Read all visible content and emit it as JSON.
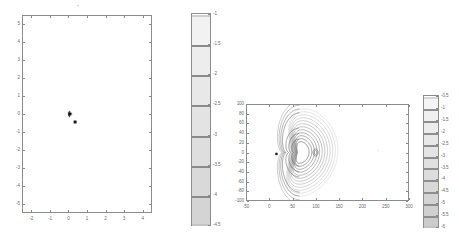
{
  "figure": {
    "background": "#ffffff",
    "axis_color": "#8c8c8c",
    "label_color": "#6b6b6b",
    "marker_color": "#1a1a1a"
  },
  "chart_data": [
    {
      "id": "left-contour",
      "type": "contour",
      "title": "",
      "xlabel": "",
      "ylabel": "",
      "xlim": [
        -2.5,
        4.5
      ],
      "ylim": [
        -5.5,
        5.5
      ],
      "xticks": [
        -2,
        -1,
        0,
        1,
        2,
        3,
        4
      ],
      "yticks": [
        5,
        4,
        3,
        2,
        1,
        0,
        -1,
        -2,
        -3,
        -4,
        -5
      ],
      "xticklabels": [
        "-2",
        "-1",
        "0",
        "1",
        "2",
        "3",
        "4"
      ],
      "yticklabels": [
        "5",
        "4",
        "3",
        "2",
        "1",
        "0",
        "-1",
        "-2",
        "-3",
        "-4",
        "-5"
      ],
      "grid": false,
      "legend": null,
      "contour_levels": [
        -1,
        -1.5,
        -2,
        -2.5,
        -3,
        -3.5,
        -4,
        -4.5
      ],
      "level_colors": [
        "#c9c9c9",
        "#b5b5b5",
        "#9e9e9e",
        "#8a8a8a",
        "#767676",
        "#626262",
        "#4e4e4e",
        "#3a3a3a"
      ],
      "marker": {
        "x": 0.35,
        "y": -0.45,
        "shape": "square",
        "color": "#1a1a1a"
      },
      "feature_center": {
        "x": 1.0,
        "y": 0.0
      },
      "description": "nested lens-shaped contour rings, cusp on left edge, saddle node near x=2"
    },
    {
      "id": "right-contour",
      "type": "contour",
      "title": "",
      "xlabel": "",
      "ylabel": "",
      "xlim": [
        -50,
        300
      ],
      "ylim": [
        -100,
        100
      ],
      "xticks": [
        -50,
        0,
        50,
        100,
        150,
        200,
        250,
        300
      ],
      "yticks": [
        100,
        80,
        60,
        40,
        20,
        0,
        -20,
        -40,
        -60,
        -80,
        -100
      ],
      "xticklabels": [
        "-50",
        "0",
        "50",
        "100",
        "150",
        "200",
        "250",
        "300"
      ],
      "yticklabels": [
        "100",
        "80",
        "60",
        "40",
        "20",
        "0",
        "-20",
        "-40",
        "-60",
        "-80",
        "-100"
      ],
      "grid": false,
      "legend": null,
      "contour_levels": [
        -0.5,
        -1,
        -1.5,
        -2,
        -2.5,
        -3,
        -3.5,
        -4,
        -4.5,
        -5,
        -5.5,
        -6
      ],
      "level_colors": [
        "#d2d2d2",
        "#c4c4c4",
        "#b6b6b6",
        "#a8a8a8",
        "#9a9a9a",
        "#8c8c8c",
        "#7e7e7e",
        "#707070",
        "#626262",
        "#545454",
        "#464646",
        "#383838"
      ],
      "marker": {
        "x": 14,
        "y": -3,
        "shape": "square",
        "color": "#1a1a1a"
      },
      "feature_center": {
        "x": 30,
        "y": 0
      },
      "description": "nested ovoid contour rings clustered near x=25, y=0"
    }
  ],
  "colorbars": [
    {
      "id": "colorbar-left",
      "orientation": "vertical",
      "tick_side": "right",
      "ticks": [
        "-1",
        "-1.5",
        "-2",
        "-2.5",
        "-3",
        "-3.5",
        "-4",
        "-4.5"
      ],
      "vmin": -4.5,
      "vmax": -1,
      "cell_colors": [
        "#f2f2f2",
        "#ededed",
        "#e8e8e8",
        "#e3e3e3",
        "#dedede",
        "#d9d9d9",
        "#d4d4d4"
      ],
      "band_colors": [
        "#cfcfcf",
        "#8a8a8a",
        "#8a8a8a",
        "#8a8a8a",
        "#8a8a8a",
        "#8a8a8a",
        "#8a8a8a",
        "#c4c4c4"
      ]
    },
    {
      "id": "colorbar-right",
      "orientation": "vertical",
      "tick_side": "right",
      "ticks": [
        "-0.5",
        "-1",
        "-1.5",
        "-2",
        "-2.5",
        "-3",
        "-3.5",
        "-4",
        "-4.5",
        "-5",
        "-5.5",
        "-6"
      ],
      "vmin": -6,
      "vmax": -0.5,
      "cell_colors": [
        "#f4f4f4",
        "#f0f0f0",
        "#ececec",
        "#e8e8e8",
        "#e4e4e4",
        "#e0e0e0",
        "#dcdcdc",
        "#d8d8d8",
        "#d4d4d4",
        "#d0d0d0",
        "#cccccc"
      ],
      "band_colors": [
        "#d6d6d6",
        "#8e8e8e",
        "#8e8e8e",
        "#8e8e8e",
        "#8e8e8e",
        "#8e8e8e",
        "#8e8e8e",
        "#8e8e8e",
        "#8e8e8e",
        "#8e8e8e",
        "#8e8e8e",
        "#c2c2c2"
      ]
    }
  ]
}
